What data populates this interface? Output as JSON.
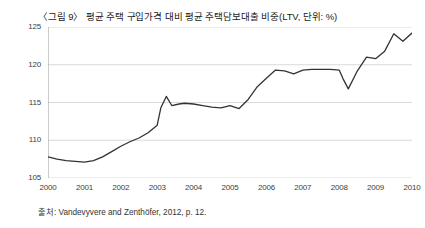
{
  "chart_data": {
    "type": "line",
    "title": "〈그림 9〉 평균 주택 구입가격 대비 평균 주택담보대출 비중(LTV, 단위: %)",
    "source": "출처: Vandevyvere and Zenthöfer, 2012, p. 12.",
    "xlabel": "",
    "ylabel": "",
    "xlim": [
      2000,
      2010
    ],
    "ylim": [
      105,
      125
    ],
    "yticks": [
      105,
      110,
      115,
      120,
      125
    ],
    "xticks": [
      2000,
      2001,
      2002,
      2003,
      2004,
      2005,
      2006,
      2007,
      2008,
      2009,
      2010
    ],
    "grid": true,
    "legend": false,
    "line_color": "#333333",
    "grid_color": "#d9d9d9",
    "series": [
      {
        "name": "LTV",
        "x": [
          2000.0,
          2000.25,
          2000.5,
          2000.75,
          2001.0,
          2001.25,
          2001.5,
          2001.75,
          2002.0,
          2002.25,
          2002.5,
          2002.75,
          2003.0,
          2003.1,
          2003.25,
          2003.4,
          2003.6,
          2003.75,
          2004.0,
          2004.25,
          2004.5,
          2004.75,
          2005.0,
          2005.25,
          2005.5,
          2005.75,
          2006.0,
          2006.25,
          2006.5,
          2006.75,
          2007.0,
          2007.25,
          2007.5,
          2007.75,
          2008.0,
          2008.1,
          2008.25,
          2008.5,
          2008.75,
          2009.0,
          2009.25,
          2009.5,
          2009.75,
          2010.0
        ],
        "y": [
          107.8,
          107.5,
          107.3,
          107.2,
          107.1,
          107.3,
          107.8,
          108.5,
          109.2,
          109.8,
          110.3,
          111.0,
          112.0,
          114.3,
          115.8,
          114.6,
          114.8,
          114.9,
          114.8,
          114.6,
          114.4,
          114.3,
          114.6,
          114.2,
          115.4,
          117.1,
          118.2,
          119.3,
          119.2,
          118.8,
          119.3,
          119.4,
          119.4,
          119.4,
          119.3,
          118.2,
          116.8,
          119.2,
          121.0,
          120.8,
          121.8,
          124.1,
          123.1,
          124.2
        ]
      }
    ]
  }
}
